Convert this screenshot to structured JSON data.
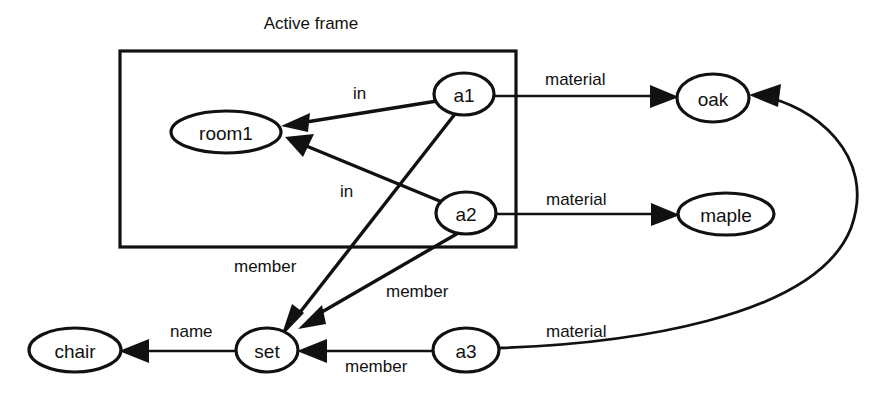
{
  "diagram": {
    "title": "Active frame",
    "frame": {
      "label": "Active frame",
      "x": 120,
      "y": 51,
      "width": 396,
      "height": 196
    },
    "nodes": [
      {
        "id": "room1",
        "label": "room1",
        "cx": 226,
        "cy": 132,
        "rx": 55,
        "ry": 21,
        "inside_frame": true
      },
      {
        "id": "a1",
        "label": "a1",
        "cx": 464,
        "cy": 94,
        "rx": 30,
        "ry": 21,
        "inside_frame": true
      },
      {
        "id": "a2",
        "label": "a2",
        "cx": 466,
        "cy": 213,
        "rx": 30,
        "ry": 21,
        "inside_frame": true
      },
      {
        "id": "oak",
        "label": "oak",
        "cx": 713,
        "cy": 98,
        "rx": 36,
        "ry": 24,
        "inside_frame": false
      },
      {
        "id": "maple",
        "label": "maple",
        "cx": 726,
        "cy": 214,
        "rx": 48,
        "ry": 21,
        "inside_frame": false
      },
      {
        "id": "chair",
        "label": "chair",
        "cx": 75,
        "cy": 350,
        "rx": 46,
        "ry": 22,
        "inside_frame": false
      },
      {
        "id": "set",
        "label": "set",
        "cx": 267,
        "cy": 350,
        "rx": 31,
        "ry": 22,
        "inside_frame": false
      },
      {
        "id": "a3",
        "label": "a3",
        "cx": 466,
        "cy": 350,
        "rx": 33,
        "ry": 22,
        "inside_frame": false
      }
    ],
    "edges": [
      {
        "id": "a1-in-room1",
        "from": "a1",
        "to": "room1",
        "label": "in",
        "label_x": 353,
        "label_y": 93
      },
      {
        "id": "a2-in-room1",
        "from": "a2",
        "to": "room1",
        "label": "in",
        "label_x": 340,
        "label_y": 191
      },
      {
        "id": "a1-material-oak",
        "from": "a1",
        "to": "oak",
        "label": "material",
        "label_x": 545,
        "label_y": 79
      },
      {
        "id": "a2-material-maple",
        "from": "a2",
        "to": "maple",
        "label": "material",
        "label_x": 546,
        "label_y": 199
      },
      {
        "id": "a1-member-set",
        "from": "a1",
        "to": "set",
        "label": "member",
        "label_x": 234,
        "label_y": 266
      },
      {
        "id": "a2-member-set",
        "from": "a2",
        "to": "set",
        "label": "member",
        "label_x": 386,
        "label_y": 291
      },
      {
        "id": "a3-member-set",
        "from": "a3",
        "to": "set",
        "label": "member",
        "label_x": 345,
        "label_y": 366
      },
      {
        "id": "a3-material-oak",
        "from": "a3",
        "to": "oak",
        "label": "material",
        "label_x": 546,
        "label_y": 331
      },
      {
        "id": "set-name-chair",
        "from": "set",
        "to": "chair",
        "label": "name",
        "label_x": 170,
        "label_y": 331
      }
    ],
    "colors": {
      "stroke": "#111111",
      "background": "#ffffff",
      "node_fill": "#ffffff"
    }
  }
}
